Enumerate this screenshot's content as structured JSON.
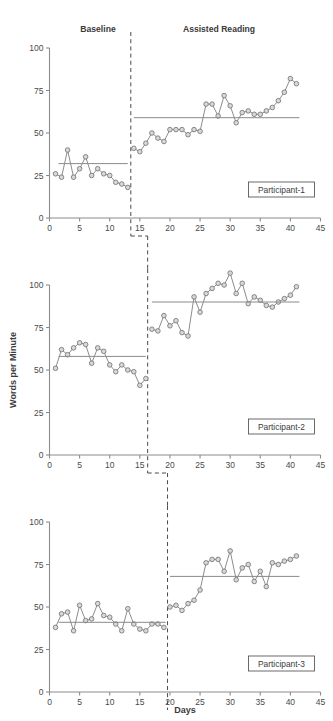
{
  "figure": {
    "xlabel": "Days",
    "ylabel": "Words per Minute",
    "phase_labels": {
      "baseline": "Baseline",
      "intervention": "Assisted Reading"
    },
    "x_ticks": [
      "0",
      "5",
      "10",
      "15",
      "20",
      "25",
      "30",
      "35",
      "40",
      "45"
    ],
    "y_ticks": [
      "0",
      "25",
      "50",
      "75",
      "100"
    ],
    "xlim": [
      0,
      45
    ],
    "ylim": [
      0,
      100
    ]
  },
  "chart_data": {
    "type": "line",
    "subtitle": "Multiple-baseline design across three participants",
    "xlabel": "Days",
    "ylabel": "Words per Minute",
    "xlim": [
      0,
      45
    ],
    "ylim": [
      0,
      100
    ],
    "x_ticks": [
      0,
      5,
      10,
      15,
      20,
      25,
      30,
      35,
      40,
      45
    ],
    "y_ticks": [
      0,
      25,
      50,
      75,
      100
    ],
    "grid": false,
    "legend_position": "inside-bottom-right",
    "phase_labels": [
      "Baseline",
      "Assisted Reading"
    ],
    "panels": [
      {
        "name": "Participant-1",
        "label": "Participant-1",
        "phase_change_x": 13.5,
        "baseline": {
          "mean": 32,
          "mean_line_x": [
            1.5,
            13.0
          ],
          "x": [
            1,
            2,
            3,
            4,
            5,
            6,
            7,
            8,
            9,
            10,
            11,
            12,
            13
          ],
          "y": [
            26,
            24,
            40,
            24,
            29,
            36,
            25,
            29,
            26,
            25,
            21,
            20,
            18
          ]
        },
        "intervention": {
          "mean": 59,
          "mean_line_x": [
            14.0,
            41.5
          ],
          "x": [
            14,
            15,
            16,
            17,
            18,
            19,
            20,
            21,
            22,
            23,
            24,
            25,
            26,
            27,
            28,
            29,
            30,
            31,
            32,
            33,
            34,
            35,
            36,
            37,
            38,
            39,
            40,
            41
          ],
          "y": [
            41,
            39,
            44,
            50,
            47,
            45,
            52,
            52,
            52,
            49,
            52,
            51,
            67,
            67,
            60,
            72,
            66,
            56,
            62,
            63,
            61,
            61,
            63,
            65,
            69,
            74,
            82,
            79
          ]
        }
      },
      {
        "name": "Participant-2",
        "label": "Participant-2",
        "phase_change_x": 16.3,
        "baseline": {
          "mean": 58,
          "mean_line_x": [
            1.5,
            16.0
          ],
          "x": [
            1,
            2,
            3,
            4,
            5,
            6,
            7,
            8,
            9,
            10,
            11,
            12,
            13,
            14,
            15,
            16
          ],
          "y": [
            51,
            62,
            59,
            63,
            66,
            65,
            54,
            63,
            61,
            53,
            49,
            53,
            50,
            49,
            41,
            45
          ]
        },
        "intervention": {
          "mean": 90,
          "mean_line_x": [
            17.0,
            41.5
          ],
          "x": [
            17,
            18,
            19,
            20,
            21,
            22,
            23,
            24,
            25,
            26,
            27,
            28,
            29,
            30,
            31,
            32,
            33,
            34,
            35,
            36,
            37,
            38,
            39,
            40,
            41
          ],
          "y": [
            74,
            73,
            82,
            76,
            79,
            72,
            70,
            93,
            84,
            95,
            98,
            101,
            100,
            107,
            95,
            101,
            89,
            93,
            91,
            88,
            87,
            90,
            92,
            94,
            99
          ]
        }
      },
      {
        "name": "Participant-3",
        "label": "Participant-3",
        "phase_change_x": 19.6,
        "baseline": {
          "mean": 41,
          "mean_line_x": [
            1.5,
            19.3
          ],
          "x": [
            1,
            2,
            3,
            4,
            5,
            6,
            7,
            8,
            9,
            10,
            11,
            12,
            13,
            14,
            15,
            16,
            17,
            18,
            19
          ],
          "y": [
            38,
            46,
            47,
            36,
            51,
            42,
            43,
            52,
            45,
            44,
            40,
            36,
            49,
            40,
            37,
            36,
            40,
            40,
            38
          ]
        },
        "intervention": {
          "mean": 68,
          "mean_line_x": [
            20.0,
            41.5
          ],
          "x": [
            20,
            21,
            22,
            23,
            24,
            25,
            26,
            27,
            28,
            29,
            30,
            31,
            32,
            33,
            34,
            35,
            36,
            37,
            38,
            39,
            40,
            41
          ],
          "y": [
            50,
            51,
            48,
            52,
            54,
            60,
            76,
            78,
            78,
            71,
            83,
            66,
            73,
            75,
            65,
            71,
            62,
            76,
            75,
            77,
            78,
            80
          ]
        }
      }
    ]
  }
}
